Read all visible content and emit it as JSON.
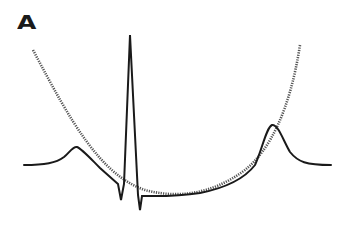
{
  "figure": {
    "panel_label": "A",
    "colors": {
      "trace": "#1a1a1a",
      "parabola": "#555555",
      "background": "#ffffff"
    }
  }
}
